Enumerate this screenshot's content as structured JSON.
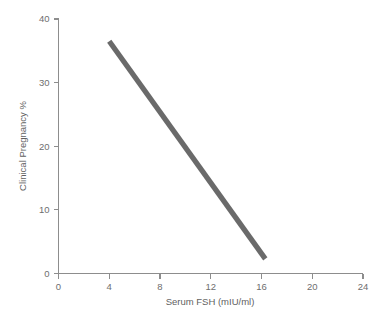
{
  "chart_data": {
    "type": "line",
    "title": "",
    "subtitle": "",
    "xlabel": "Serum FSH (mIU/ml)",
    "ylabel": "Clinical Pregnancy %",
    "xlim": [
      0,
      24
    ],
    "ylim": [
      0,
      40
    ],
    "xticks": [
      0,
      4,
      8,
      12,
      16,
      20,
      24
    ],
    "yticks": [
      0,
      10,
      20,
      30,
      40
    ],
    "xtick_labels": [
      "0",
      "4",
      "8",
      "12",
      "16",
      "20",
      "24"
    ],
    "ytick_labels": [
      "0",
      "10",
      "20",
      "30",
      "40"
    ],
    "grid": false,
    "legend": false,
    "legend_position": "none",
    "series": [
      {
        "name": "Clinical Pregnancy vs Serum FSH",
        "color": "#6a6a6a",
        "line_width": 5.2,
        "x": [
          4.0,
          16.3
        ],
        "values": [
          36.5,
          2.3
        ]
      }
    ],
    "annotations": []
  },
  "style": {
    "background": "#ffffff",
    "axis_color": "#8d8d8d",
    "tick_text_color": "#6e6e6e",
    "axis_title_color": "#5f5f5f",
    "series_color": "#6a6a6a"
  }
}
